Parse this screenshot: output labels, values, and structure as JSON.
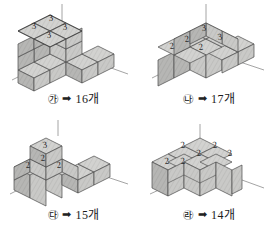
{
  "panels": [
    {
      "id": "panel-a",
      "mark": "㉮",
      "arrow": "➡",
      "count": "16개",
      "figure_name": "cube-stack-a",
      "top_labels": [
        "3",
        "3",
        "3",
        "3"
      ],
      "description": "3-level stack: 2x2 tower of height 3 plus an L of single cubes at base",
      "cube_count": 16,
      "layers": [
        {
          "level": 3,
          "labels": [
            "3",
            "3",
            "3",
            "3"
          ]
        },
        {
          "level": 2,
          "labels": []
        },
        {
          "level": 1,
          "labels": []
        }
      ]
    },
    {
      "id": "panel-b",
      "mark": "㉯",
      "arrow": "➡",
      "count": "17개",
      "figure_name": "cube-stack-b",
      "top_labels": [
        "3",
        "3",
        "2",
        "2",
        "2"
      ],
      "description": "Stepped stack with two cubes at height 3 and a row at height 2",
      "cube_count": 17,
      "layers": [
        {
          "level": 3,
          "labels": [
            "3",
            "3"
          ]
        },
        {
          "level": 2,
          "labels": [
            "2",
            "2",
            "2"
          ]
        },
        {
          "level": 1,
          "labels": []
        }
      ]
    },
    {
      "id": "panel-c",
      "mark": "㉰",
      "arrow": "➡",
      "count": "15개",
      "figure_name": "cube-stack-c",
      "top_labels": [
        "3",
        "2",
        "2",
        "2"
      ],
      "description": "Pyramid-like stack: one cube at height 3, three at height 2",
      "cube_count": 15,
      "layers": [
        {
          "level": 3,
          "labels": [
            "3"
          ]
        },
        {
          "level": 2,
          "labels": [
            "2",
            "2",
            "2"
          ]
        },
        {
          "level": 1,
          "labels": []
        }
      ]
    },
    {
      "id": "panel-d",
      "mark": "㉱",
      "arrow": "➡",
      "count": "14개",
      "figure_name": "cube-stack-d",
      "top_labels": [
        "2",
        "2",
        "2",
        "2",
        "2",
        "2"
      ],
      "description": "Two-level slab with six cubes at height 2",
      "cube_count": 14,
      "layers": [
        {
          "level": 2,
          "labels": [
            "2",
            "2",
            "2",
            "2",
            "2",
            "2"
          ]
        },
        {
          "level": 1,
          "labels": []
        }
      ]
    }
  ],
  "colors": {
    "top_face": "#d8d8d6",
    "left_face": "#b9b9b7",
    "right_face": "#cdcdcb",
    "outline": "#4a4a4a",
    "axis": "#8a8a8a",
    "text": "#1b1b1b"
  }
}
